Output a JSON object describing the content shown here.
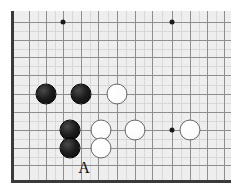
{
  "diagram": {
    "kind": "go-board-problem",
    "board": {
      "background_color": "#eeeeee",
      "grid_color": "#8e8e8e",
      "sub_grid_color": "#d8d8d8",
      "border_color": "#3a3a3a",
      "cell_size": 17.3,
      "origin_x": 29,
      "origin_y": 22,
      "columns": 12,
      "rows": 9,
      "edges_shown": [
        "left",
        "bottom"
      ]
    },
    "star_points": [
      {
        "name": "star-point-top-left",
        "x": 63,
        "y": 22
      },
      {
        "name": "star-point-top-right",
        "x": 172,
        "y": 22
      },
      {
        "name": "star-point-right",
        "x": 172,
        "y": 130
      }
    ],
    "stones": [
      {
        "name": "black-stone-1",
        "color": "black",
        "x": 46,
        "y": 94
      },
      {
        "name": "black-stone-2",
        "color": "black",
        "x": 81,
        "y": 94
      },
      {
        "name": "white-stone-1",
        "color": "white",
        "x": 117,
        "y": 94
      },
      {
        "name": "black-stone-3",
        "color": "black",
        "x": 70,
        "y": 130
      },
      {
        "name": "black-stone-4",
        "color": "black",
        "x": 70,
        "y": 148
      },
      {
        "name": "white-stone-2",
        "color": "white",
        "x": 101,
        "y": 130
      },
      {
        "name": "white-stone-3",
        "color": "white",
        "x": 101,
        "y": 148
      },
      {
        "name": "white-stone-4",
        "color": "white",
        "x": 135,
        "y": 130
      },
      {
        "name": "white-stone-5",
        "color": "white",
        "x": 190,
        "y": 130
      }
    ],
    "labels": [
      {
        "name": "point-label-a",
        "text": "A",
        "x": 84,
        "y": 168
      }
    ],
    "grid_lines_vertical": [
      29,
      46,
      63,
      81,
      98,
      117,
      135,
      152,
      172,
      190,
      207,
      224
    ],
    "grid_lines_horizontal": [
      22,
      40,
      57,
      75,
      94,
      112,
      130,
      148,
      165
    ],
    "sub_grid_vertical": [
      37.5,
      54.5,
      72,
      89.5,
      107.5,
      126,
      143.5,
      162,
      181,
      198.5,
      215.5
    ],
    "sub_grid_horizontal": [
      31,
      48.5,
      66,
      84.5,
      103,
      121,
      139,
      156.5
    ]
  }
}
